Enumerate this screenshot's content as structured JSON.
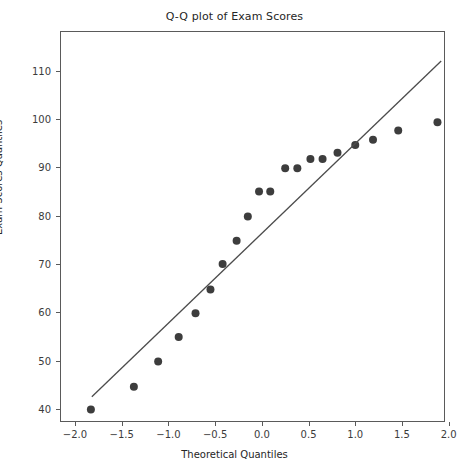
{
  "chart_data": {
    "type": "scatter",
    "title": "Q-Q plot of Exam Scores",
    "xlabel": "Theoretical Quantiles",
    "ylabel": "Exam Scores Quantiles",
    "xlim": [
      -2.15,
      1.95
    ],
    "ylim": [
      37.5,
      118.0
    ],
    "xticks": [
      -2.0,
      -1.5,
      -1.0,
      -0.5,
      0.0,
      0.5,
      1.0,
      1.5,
      2.0
    ],
    "xtick_labels": [
      "−2.0",
      "−1.5",
      "−1.0",
      "−0.5",
      "0.0",
      "0.5",
      "1.0",
      "1.5",
      "2.0"
    ],
    "yticks": [
      40,
      50,
      60,
      70,
      80,
      90,
      100,
      110
    ],
    "ytick_labels": [
      "40",
      "50",
      "60",
      "70",
      "80",
      "90",
      "100",
      "110"
    ],
    "grid": false,
    "legend": null,
    "marker_color": "#3d3d3d",
    "line_color": "#4c4c4c",
    "frame_color": "#5a5a5a",
    "series": [
      {
        "name": "Sample quantiles",
        "type": "scatter",
        "x": [
          -1.83,
          -1.37,
          -1.11,
          -0.89,
          -0.71,
          -0.55,
          -0.42,
          -0.27,
          -0.15,
          -0.03,
          0.09,
          0.25,
          0.38,
          0.52,
          0.65,
          0.81,
          1.0,
          1.19,
          1.46,
          1.88
        ],
        "y": [
          39.9,
          44.6,
          49.8,
          54.9,
          59.8,
          64.7,
          70.0,
          74.8,
          79.8,
          85.0,
          85.0,
          89.8,
          89.8,
          91.7,
          91.7,
          93.0,
          94.6,
          95.7,
          97.6,
          99.3
        ]
      },
      {
        "name": "Reference line",
        "type": "line",
        "x": [
          -1.82,
          1.92
        ],
        "y": [
          42.5,
          112.0
        ]
      }
    ]
  }
}
